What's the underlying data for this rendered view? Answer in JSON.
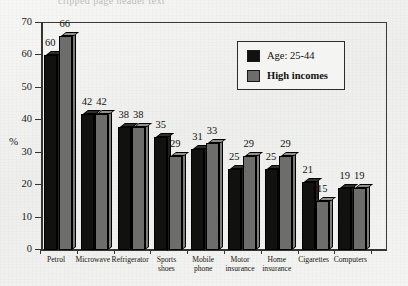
{
  "top_cropped_text": "clipped page header text",
  "colors": {
    "series_1": "#111110",
    "series_2": "#6d6d6b",
    "axis": "#35352f",
    "background": "#f2f2f0",
    "text": "#121210"
  },
  "legend": {
    "position": "top-right-inside",
    "entries": [
      {
        "label": "Age: 25-44",
        "color": "#111110",
        "bold": false
      },
      {
        "label": "High incomes",
        "color": "#6d6d6b",
        "bold": true
      }
    ]
  },
  "axis": {
    "y_title": "%",
    "y_ticks": [
      "0",
      "10",
      "20",
      "30",
      "40",
      "50",
      "60",
      "70"
    ]
  },
  "chart_data": {
    "type": "bar",
    "title": "",
    "xlabel": "",
    "ylabel": "%",
    "ylim": [
      0,
      70
    ],
    "ytick_step": 10,
    "grid": false,
    "legend_position": "upper right",
    "categories": [
      "Petrol",
      "Microwave",
      "Refrigerator",
      "Sports\nshoes",
      "Mobile\nphone",
      "Motor\ninsurance",
      "Home\ninsurance",
      "Cigarettes",
      "Computers"
    ],
    "series": [
      {
        "name": "Age: 25-44",
        "color": "#111110",
        "values": [
          60,
          42,
          38,
          35,
          31,
          25,
          25,
          21,
          19
        ]
      },
      {
        "name": "High incomes",
        "color": "#6d6d6b",
        "values": [
          66,
          42,
          38,
          29,
          33,
          29,
          29,
          15,
          19
        ]
      }
    ]
  }
}
